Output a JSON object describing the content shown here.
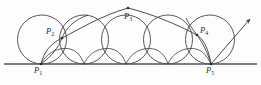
{
  "figure": {
    "kind": "cycloid-rolling-circles-diagram",
    "background_color": "#fdfdfd",
    "stroke_color": "#3a3a3a",
    "baseline_color": "#555555",
    "label_color": "#2b2b2b",
    "baseline": {
      "y": 64,
      "x_start": 4,
      "x_end": 257
    },
    "circles": [
      {
        "cx": 42,
        "cy": 39.5,
        "r": 24.5
      },
      {
        "cx": 84,
        "cy": 39.5,
        "r": 24.5
      },
      {
        "cx": 126,
        "cy": 39.5,
        "r": 24.5
      },
      {
        "cx": 168,
        "cy": 39.5,
        "r": 24.5
      },
      {
        "cx": 210,
        "cy": 39.5,
        "r": 24.5
      }
    ],
    "points": [
      {
        "id": "P1",
        "label": "P",
        "subscript": "1",
        "x": 41,
        "y": 64,
        "label_x": 34,
        "label_y": 66
      },
      {
        "id": "P2",
        "label": "P",
        "subscript": "2",
        "x": 62,
        "y": 38,
        "label_x": 46,
        "label_y": 27
      },
      {
        "id": "P3",
        "label": "P",
        "subscript": "3",
        "x": 128,
        "y": 8,
        "label_x": 124,
        "label_y": 12
      },
      {
        "id": "P4",
        "label": "P",
        "subscript": "4",
        "x": 197,
        "y": 35,
        "label_x": 200,
        "label_y": 26
      },
      {
        "id": "P5",
        "label": "P",
        "subscript": "5",
        "x": 211,
        "y": 64,
        "label_x": 206,
        "label_y": 66
      }
    ],
    "arrow": {
      "tip_x": 252,
      "tip_y": 17,
      "from_x": 211,
      "from_y": 64
    }
  }
}
